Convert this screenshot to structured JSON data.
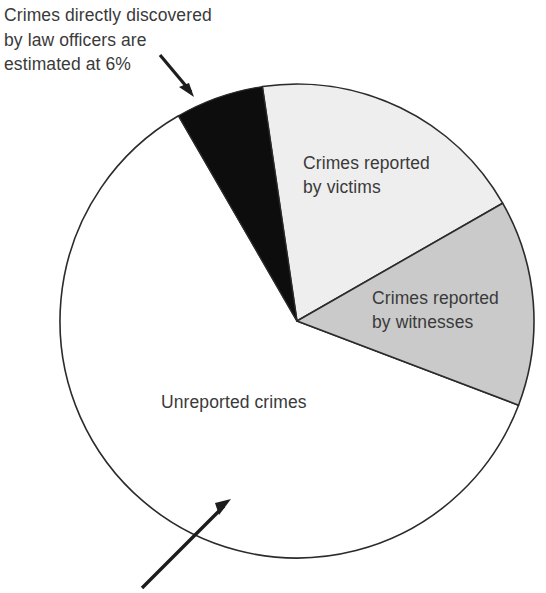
{
  "figure": {
    "background": "#ffffff",
    "text_color": "#3a3a3a"
  },
  "annotations": [
    {
      "id": "officers-note",
      "text": "Crimes directly discovered\nby law officers are\nestimated at 6%",
      "arrow": "arrow-down-right-icon"
    },
    {
      "id": "unreported-pointer",
      "text": "",
      "arrow": "arrow-up-right-icon"
    }
  ],
  "chart_data": {
    "type": "pie",
    "title": "",
    "subtitle": "",
    "xlabel": "",
    "ylabel": "",
    "grid": false,
    "legend_position": "none",
    "labels_inside": true,
    "center": {
      "x": 297,
      "y": 321
    },
    "radius": 237,
    "start_angle_deg": -120,
    "categories": [
      "Crimes directly discovered by law officers",
      "Crimes reported by victims",
      "Crimes reported by witnesses",
      "Unreported crimes"
    ],
    "values": [
      6,
      19,
      14,
      61
    ],
    "value_unit": "percent",
    "slices": [
      {
        "name": "officers",
        "label": "",
        "value": 6,
        "color": "#0d0d0d",
        "stroke": "#2b2b2b",
        "start_angle_deg": -120,
        "end_angle_deg": -98.4
      },
      {
        "name": "victims",
        "label": "Crimes reported\nby victims",
        "value": 19,
        "color": "#eeeeee",
        "stroke": "#2b2b2b",
        "start_angle_deg": -98.4,
        "end_angle_deg": -29.8
      },
      {
        "name": "witnesses",
        "label": "Crimes reported\nby witnesses",
        "value": 14,
        "color": "#cacaca",
        "stroke": "#2b2b2b",
        "start_angle_deg": -29.8,
        "end_angle_deg": 20.8
      },
      {
        "name": "unreported",
        "label": "Unreported crimes",
        "value": 61,
        "color": "#ffffff",
        "stroke": "#2b2b2b",
        "start_angle_deg": 20.8,
        "end_angle_deg": 240
      }
    ],
    "annotation_texts": [
      "Crimes directly discovered by law officers are estimated at 6%"
    ]
  }
}
